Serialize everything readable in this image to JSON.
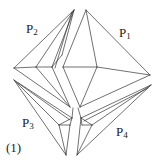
{
  "figure": {
    "caption": "(1)",
    "pieces": [
      {
        "name": "P",
        "sub": "1"
      },
      {
        "name": "P",
        "sub": "2"
      },
      {
        "name": "P",
        "sub": "3"
      },
      {
        "name": "P",
        "sub": "4"
      }
    ]
  }
}
